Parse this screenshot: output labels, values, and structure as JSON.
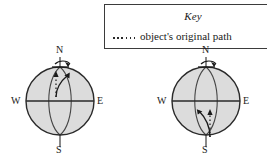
{
  "key": {
    "title": "Key",
    "entry_label": "object's original path",
    "line_style": "dotted",
    "border_color": "#3b3b3b"
  },
  "globes": [
    {
      "id": "globe-left",
      "name": "northern-hemisphere-deflection-globe",
      "compass": {
        "north": "N",
        "south": "S",
        "east": "E",
        "west": "W"
      },
      "fill_color": "#dcdcdc",
      "outline_color": "#2a2a2a",
      "hemisphere_with_paths": "northern",
      "deflection_direction": "right",
      "rotation_arrow": "counterclockwise-at-north-pole",
      "paths": [
        {
          "name": "original-path",
          "style": "dotted",
          "shape": "straight",
          "arrowhead": "up"
        },
        {
          "name": "deflected-path",
          "style": "solid",
          "shape": "curved-right",
          "arrowhead": "up-right"
        }
      ]
    },
    {
      "id": "globe-right",
      "name": "southern-hemisphere-deflection-globe",
      "compass": {
        "north": "N",
        "south": "S",
        "east": "E",
        "west": "W"
      },
      "fill_color": "#dcdcdc",
      "outline_color": "#2a2a2a",
      "hemisphere_with_paths": "southern",
      "deflection_direction": "left",
      "rotation_arrow": "counterclockwise-at-north-pole",
      "paths": [
        {
          "name": "original-path",
          "style": "dotted",
          "shape": "straight",
          "arrowhead": "up"
        },
        {
          "name": "deflected-path",
          "style": "solid",
          "shape": "curved-left",
          "arrowhead": "up-left"
        }
      ]
    }
  ]
}
